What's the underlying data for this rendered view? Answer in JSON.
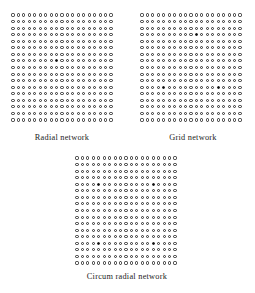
{
  "figure": {
    "title": "",
    "background_color": "#ffffff",
    "node_color_open": "#ffffff",
    "node_outline_color": "#2a2a2a",
    "node_color_filled": "#111111"
  },
  "panels": [
    {
      "id": "radial",
      "caption": "Radial network",
      "columns": 19,
      "rows": 17,
      "filled_nodes": [
        [
          8,
          7
        ]
      ]
    },
    {
      "id": "grid",
      "caption": "Grid network",
      "columns": 19,
      "rows": 17,
      "filled_nodes": [
        [
          10,
          3
        ],
        [
          4,
          11
        ],
        [
          14,
          11
        ]
      ]
    },
    {
      "id": "circum",
      "caption": "Circum radial network",
      "columns": 19,
      "rows": 17,
      "filled_nodes": [
        [
          4,
          4
        ],
        [
          14,
          4
        ],
        [
          4,
          13
        ],
        [
          14,
          13
        ]
      ]
    }
  ],
  "chart_data": {
    "type": "scatter",
    "title": "",
    "xlabel": "",
    "ylabel": "",
    "panels": [
      {
        "name": "Radial network",
        "grid_columns": 19,
        "grid_rows": 17,
        "total_nodes": 323,
        "filled_node_count": 1,
        "filled_nodes": [
          {
            "col": 8,
            "row": 7
          }
        ]
      },
      {
        "name": "Grid network",
        "grid_columns": 19,
        "grid_rows": 17,
        "total_nodes": 323,
        "filled_node_count": 3,
        "filled_nodes": [
          {
            "col": 10,
            "row": 3
          },
          {
            "col": 4,
            "row": 11
          },
          {
            "col": 14,
            "row": 11
          }
        ]
      },
      {
        "name": "Circum radial network",
        "grid_columns": 19,
        "grid_rows": 17,
        "total_nodes": 323,
        "filled_node_count": 4,
        "filled_nodes": [
          {
            "col": 4,
            "row": 4
          },
          {
            "col": 14,
            "row": 4
          },
          {
            "col": 4,
            "row": 13
          },
          {
            "col": 14,
            "row": 13
          }
        ]
      }
    ],
    "legend": [],
    "grid": false
  }
}
